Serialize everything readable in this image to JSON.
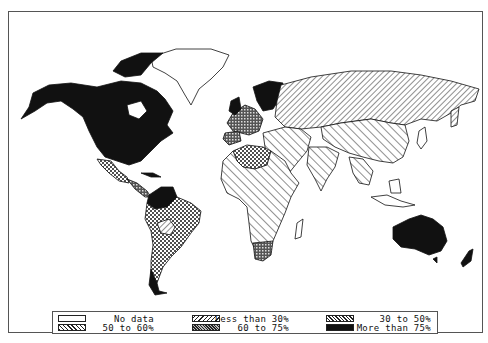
{
  "map": {
    "type": "choropleth",
    "subject": "World map shaded by percentage categories",
    "regions": [
      {
        "name": "North America (USA/Canada)",
        "category": "More than 75%"
      },
      {
        "name": "Mexico",
        "category": "50 to 60%"
      },
      {
        "name": "Central America",
        "category": "60 to 75%"
      },
      {
        "name": "Greenland",
        "category": "No data"
      },
      {
        "name": "Colombia/Venezuela",
        "category": "More than 75%"
      },
      {
        "name": "Brazil / South America",
        "category": "50 to 60%"
      },
      {
        "name": "Bolivia",
        "category": "30 to 50%"
      },
      {
        "name": "Chile/Argentina south",
        "category": "More than 75%"
      },
      {
        "name": "Western Europe",
        "category": "60 to 75%"
      },
      {
        "name": "Scandinavia",
        "category": "More than 75%"
      },
      {
        "name": "Russia/USSR",
        "category": "30 to 50%"
      },
      {
        "name": "China/South Asia",
        "category": "Less than 30%"
      },
      {
        "name": "North Africa",
        "category": "50 to 60%"
      },
      {
        "name": "Sub-Saharan Africa",
        "category": "Less than 30%"
      },
      {
        "name": "South Africa",
        "category": "60 to 75%"
      },
      {
        "name": "Australia",
        "category": "More than 75%"
      },
      {
        "name": "New Zealand",
        "category": "More than 75%"
      }
    ]
  },
  "legend": {
    "items": [
      {
        "label": "No data",
        "pattern": "blank"
      },
      {
        "label": "Less than 30%",
        "pattern": "wide-diagonal-right"
      },
      {
        "label": "30 to 50%",
        "pattern": "diagonal-left"
      },
      {
        "label": "50 to 60%",
        "pattern": "crosshatch"
      },
      {
        "label": "60 to 75%",
        "pattern": "dense-dots"
      },
      {
        "label": "More than 75%",
        "pattern": "solid-black"
      }
    ]
  },
  "colors": {
    "ink": "#111111",
    "paper": "#ffffff",
    "border": "#555555"
  }
}
